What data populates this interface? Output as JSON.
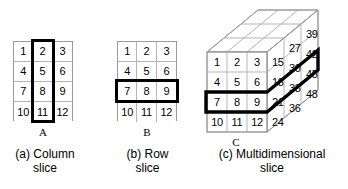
{
  "figure": {
    "title_none": "",
    "panels": [
      {
        "id": "a",
        "letter": "A",
        "caption": "(a) Column\nslice",
        "grid": {
          "rows": [
            [
              "1",
              "2",
              "3"
            ],
            [
              "4",
              "5",
              "6"
            ],
            [
              "7",
              "8",
              "9"
            ],
            [
              "10",
              "11",
              "12"
            ]
          ]
        },
        "highlight": "column-2"
      },
      {
        "id": "b",
        "letter": "B",
        "caption": "(b) Row\nslice",
        "grid": {
          "rows": [
            [
              "1",
              "2",
              "3"
            ],
            [
              "4",
              "5",
              "6"
            ],
            [
              "7",
              "8",
              "9"
            ],
            [
              "10",
              "11",
              "12"
            ]
          ]
        },
        "highlight": "row-3"
      },
      {
        "id": "c",
        "letter": "C",
        "caption": "(c) Multidimensional\nslice",
        "front_face": {
          "rows": [
            [
              "1",
              "2",
              "3"
            ],
            [
              "4",
              "5",
              "6"
            ],
            [
              "7",
              "8",
              "9"
            ],
            [
              "10",
              "11",
              "12"
            ]
          ]
        },
        "side_face": {
          "rows": [
            [
              "15",
              "27",
              "39"
            ],
            [
              "18",
              "30",
              "42"
            ],
            [
              "21",
              "33",
              "45"
            ],
            [
              "24",
              "36",
              "48"
            ]
          ]
        },
        "highlight": "row-3-through-depth"
      }
    ]
  },
  "colors": {
    "background": "#ffffff",
    "cell_border": "#b5b5b5",
    "grid_outline": "#9a9a9a",
    "highlight": "#000000",
    "text": "#000000"
  }
}
